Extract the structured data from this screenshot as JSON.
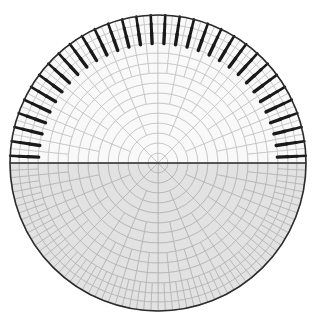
{
  "figure": {
    "background_color": "#ffffff",
    "width": 314,
    "height": 322
  },
  "geometry": {
    "center_x": 158,
    "center_y": 163,
    "radius": 148,
    "outline_color": "#2b2b2b",
    "outline_width": 1.6,
    "equator_color": "#2b2b2b",
    "equator_width": 1.6
  },
  "mesh": {
    "ring_count": 15,
    "base_sectors": 8,
    "subdivision_rings": [
      3,
      6,
      9,
      12
    ],
    "upper_fill": "#f9f9f9",
    "upper_stroke": "#b9b9b9",
    "lower_fill": "#e2e2e2",
    "lower_stroke": "#a9a9a9",
    "stroke_width": 0.6,
    "ring_radii": [
      10,
      20,
      30,
      40,
      50,
      60,
      70,
      80,
      90,
      100,
      110,
      120,
      130,
      139,
      148
    ]
  },
  "glyphs": {
    "description": "Dark radial line segments drawn in the upper half only",
    "color": "#1a1a1a",
    "half": "upper",
    "rings": [
      12,
      13,
      14
    ],
    "ring_thickness": [
      3.4,
      3.0,
      2.6
    ],
    "ring_length": [
      11,
      10,
      9
    ],
    "count_per_ring": [
      32,
      32,
      32
    ],
    "angle_start_deg": 180,
    "angle_end_deg": 360
  },
  "chart_data": {
    "type": "polar-mesh",
    "xlabel": "",
    "ylabel": "",
    "grid": true,
    "legend": "none",
    "rlim": [
      0,
      148
    ],
    "theta_range_deg": [
      0,
      360
    ],
    "series": [
      {
        "name": "upper-half-mesh",
        "theta_range_deg": [
          180,
          360
        ],
        "fill": "#f9f9f9",
        "values": [
          10,
          20,
          30,
          40,
          50,
          60,
          70,
          80,
          90,
          100,
          110,
          120,
          130,
          139,
          148
        ]
      },
      {
        "name": "lower-half-mesh",
        "theta_range_deg": [
          0,
          180
        ],
        "fill": "#e2e2e2",
        "values": [
          10,
          20,
          30,
          40,
          50,
          60,
          70,
          80,
          90,
          100,
          110,
          120,
          130,
          139,
          148
        ]
      },
      {
        "name": "radial-glyphs",
        "theta_range_deg": [
          180,
          360
        ],
        "fill": "#1a1a1a",
        "values": [
          32,
          32,
          32
        ]
      }
    ]
  }
}
